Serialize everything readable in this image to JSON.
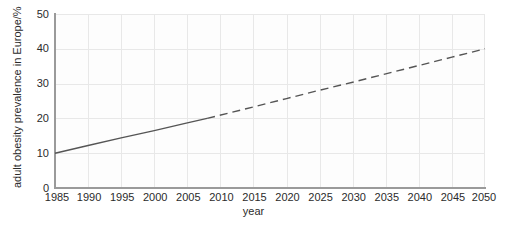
{
  "chart_data": {
    "type": "line",
    "title": "",
    "xlabel": "year",
    "ylabel": "adult obesity prevalence in Europe/%",
    "xlim": [
      1985,
      2050
    ],
    "ylim": [
      0,
      50
    ],
    "grid": true,
    "legend": "none",
    "x_ticks": [
      "1985",
      "1990",
      "1995",
      "2000",
      "2005",
      "2010",
      "2015",
      "2020",
      "2025",
      "2030",
      "2035",
      "2040",
      "2045",
      "2050"
    ],
    "y_ticks": [
      "0",
      "10",
      "20",
      "30",
      "40",
      "50"
    ],
    "x_tick_values": [
      1985,
      1990,
      1995,
      2000,
      2005,
      2010,
      2015,
      2020,
      2025,
      2030,
      2035,
      2040,
      2045,
      2050
    ],
    "y_tick_values": [
      0,
      10,
      20,
      30,
      40,
      50
    ],
    "series": [
      {
        "name": "observed",
        "style": "solid",
        "color": "#555555",
        "x": [
          1985,
          1990,
          1995,
          2000,
          2005,
          2008
        ],
        "values": [
          10.0,
          12.2,
          14.4,
          16.5,
          18.7,
          20.0
        ]
      },
      {
        "name": "projected",
        "style": "dashed",
        "color": "#555555",
        "x": [
          2008,
          2015,
          2020,
          2025,
          2030,
          2035,
          2040,
          2045,
          2050
        ],
        "values": [
          20.0,
          23.3,
          25.7,
          28.1,
          30.4,
          32.8,
          35.2,
          37.6,
          40.0
        ]
      }
    ]
  },
  "colors": {
    "line": "#555555",
    "grid": "#e8e8e8",
    "axis": "#9a9a9a",
    "text": "#2b2b2b",
    "plot_background": "#fdfdfd",
    "page_background": "#ffffff"
  }
}
